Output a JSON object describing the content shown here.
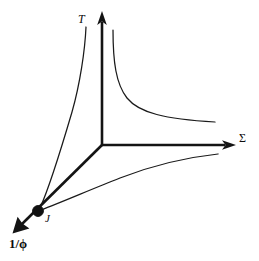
{
  "figure": {
    "background_color": "#ffffff",
    "line_color": "#141414",
    "curve_color": "#1a1a1a",
    "dot_color": "#111111",
    "width": 259,
    "height": 261
  },
  "axes": [
    {
      "id": "vertical-axis",
      "label": "T",
      "label_style": "italic",
      "direction": "up",
      "origin": [
        102,
        145
      ],
      "tip": [
        102,
        13
      ]
    },
    {
      "id": "horizontal-axis",
      "label": "Σ",
      "label_style": "upright",
      "direction": "right",
      "origin": [
        102,
        145
      ],
      "tip": [
        234,
        145
      ]
    },
    {
      "id": "diagonal-axis",
      "label": "1/ϕ",
      "label_style": "bold",
      "direction": "down-left",
      "origin": [
        102,
        145
      ],
      "tip": [
        13,
        233
      ]
    }
  ],
  "markers": [
    {
      "id": "fixed-point",
      "label": "J",
      "label_style": "italic",
      "position": [
        38,
        211
      ],
      "radius": 5.4
    }
  ],
  "curves": [
    {
      "id": "hyperbola-upper-right",
      "description": "decaying hyperbolic separatrix in the T-Sigma quadrant",
      "path": "M 113,30 C 113,62 116,84 127,98 C 139,113 165,119 215,122"
    },
    {
      "id": "separatrix-left-upper",
      "description": "thin curve from fixed point J rising to the T axis region",
      "path": "M 40,208 C 50,186 62,146 72,112 C 80,84 85,50 86,27"
    },
    {
      "id": "separatrix-lower-right",
      "description": "thin curve from fixed point J sweeping right below the Sigma axis",
      "path": "M 41,210 C 62,202 92,189 120,178 C 156,164 190,157 218,154"
    }
  ],
  "labels": {
    "vertical": "T",
    "horizontal": "Σ",
    "diagonal": "1/ϕ",
    "fixed_point": "J"
  }
}
